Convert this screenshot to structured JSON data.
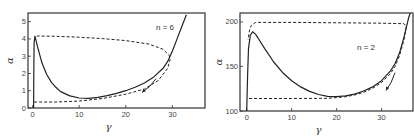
{
  "chart_data": [
    {
      "type": "line",
      "panel": "left",
      "title": "",
      "annotation": "n = 6",
      "xlabel": "γ",
      "ylabel": "α",
      "xlim": [
        -1,
        37
      ],
      "ylim": [
        0,
        5.5
      ],
      "xticks": [
        0,
        10,
        20,
        30
      ],
      "yticks": [
        0,
        1,
        2,
        3,
        4,
        5
      ],
      "grid": false,
      "series": [
        {
          "name": "solid",
          "style": "solid",
          "points": [
            [
              0.2,
              0.0
            ],
            [
              0.25,
              2.0
            ],
            [
              0.3,
              3.8
            ],
            [
              0.5,
              4.15
            ],
            [
              1,
              3.6
            ],
            [
              2,
              2.6
            ],
            [
              3,
              1.95
            ],
            [
              4,
              1.5
            ],
            [
              5,
              1.2
            ],
            [
              6,
              0.95
            ],
            [
              8,
              0.7
            ],
            [
              10,
              0.58
            ],
            [
              12,
              0.56
            ],
            [
              14,
              0.62
            ],
            [
              16,
              0.72
            ],
            [
              18,
              0.85
            ],
            [
              20,
              1.0
            ],
            [
              22,
              1.2
            ],
            [
              24,
              1.45
            ],
            [
              26,
              1.8
            ],
            [
              28,
              2.3
            ],
            [
              29,
              2.7
            ],
            [
              30,
              3.3
            ],
            [
              31,
              4.0
            ],
            [
              32,
              4.7
            ],
            [
              33,
              5.4
            ]
          ]
        },
        {
          "name": "dashed",
          "style": "dashed",
          "points": [
            [
              0.3,
              0.35
            ],
            [
              5,
              0.35
            ],
            [
              10,
              0.4
            ],
            [
              15,
              0.55
            ],
            [
              20,
              0.8
            ],
            [
              24,
              1.1
            ],
            [
              27,
              1.6
            ],
            [
              29,
              2.3
            ],
            [
              29.5,
              2.8
            ],
            [
              29.3,
              3.05
            ],
            [
              28,
              3.4
            ],
            [
              25,
              3.7
            ],
            [
              20,
              3.9
            ],
            [
              15,
              4.02
            ],
            [
              10,
              4.1
            ],
            [
              5,
              4.15
            ],
            [
              1,
              4.17
            ],
            [
              0.3,
              4.1
            ]
          ]
        }
      ],
      "arrow": {
        "from": [
          26.5,
          1.7
        ],
        "to": [
          23.5,
          0.9
        ]
      }
    },
    {
      "type": "line",
      "panel": "right",
      "title": "",
      "annotation": "n = 2",
      "xlabel": "γ",
      "ylabel": "α",
      "xlim": [
        -1.5,
        37
      ],
      "ylim": [
        100,
        210
      ],
      "xticks": [
        0,
        10,
        20,
        30
      ],
      "yticks": [
        100,
        150,
        200
      ],
      "grid": false,
      "series": [
        {
          "name": "solid",
          "style": "solid",
          "points": [
            [
              0,
              100
            ],
            [
              0.2,
              140
            ],
            [
              0.4,
              170
            ],
            [
              0.8,
              185
            ],
            [
              1.3,
              189
            ],
            [
              2,
              186
            ],
            [
              3,
              178
            ],
            [
              4,
              170
            ],
            [
              6,
              155
            ],
            [
              8,
              143
            ],
            [
              10,
              134
            ],
            [
              12,
              127
            ],
            [
              14,
              122
            ],
            [
              16,
              118.5
            ],
            [
              18,
              116.5
            ],
            [
              20,
              116
            ],
            [
              22,
              117
            ],
            [
              24,
              119
            ],
            [
              26,
              122.5
            ],
            [
              28,
              127
            ],
            [
              30,
              134
            ],
            [
              32,
              145
            ],
            [
              33,
              153
            ],
            [
              34,
              165
            ],
            [
              35,
              183
            ],
            [
              36,
              204
            ],
            [
              36.5,
              212
            ]
          ]
        },
        {
          "name": "dashed",
          "style": "dashed",
          "points": [
            [
              0.5,
              114
            ],
            [
              10,
              114
            ],
            [
              18,
              114.3
            ],
            [
              20,
              115
            ],
            [
              22,
              116
            ],
            [
              24,
              118
            ],
            [
              26,
              121
            ],
            [
              28,
              125.5
            ],
            [
              30,
              132
            ],
            [
              32,
              142
            ],
            [
              33,
              150
            ],
            [
              34,
              162
            ],
            [
              35,
              180
            ],
            [
              35.5,
              195
            ],
            [
              35,
              198
            ],
            [
              30,
              198.5
            ],
            [
              20,
              199
            ],
            [
              10,
              199.5
            ],
            [
              2,
              199.5
            ],
            [
              1,
              196
            ],
            [
              0.6,
              190
            ],
            [
              0.3,
              180
            ]
          ]
        }
      ],
      "arrow": {
        "from": [
          33,
          143
        ],
        "to": [
          31,
          123
        ]
      }
    }
  ]
}
